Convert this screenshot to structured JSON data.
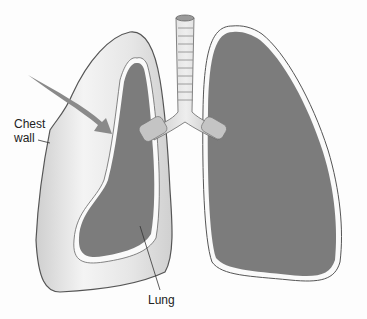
{
  "diagram": {
    "labels": {
      "chest_wall_line1": "Chest",
      "chest_wall_line2": "wall",
      "lung": "Lung"
    },
    "parts": [
      "trachea",
      "bronchi",
      "left-chest-cavity",
      "collapsed-lung",
      "right-lung",
      "arrow"
    ],
    "colors": {
      "lung_fill": "#7c7c7c",
      "cavity_fill": "#e4e4e4",
      "outline": "#555555",
      "background": "#fdfdfd"
    }
  }
}
